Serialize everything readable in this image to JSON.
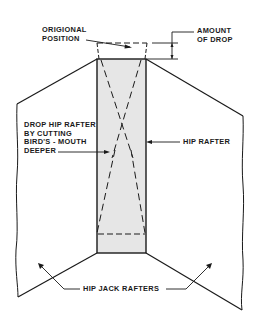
{
  "diagram": {
    "labels": {
      "original_position": [
        "ORIGIONAL",
        "POSITION"
      ],
      "amount_of_drop": [
        "AMOUNT",
        "OF DROP"
      ],
      "drop_hip_rafter": [
        "DROP HIP RAFTER",
        "BY CUTTING",
        "BIRD'S - MOUTH",
        "DEEPER"
      ],
      "hip_rafter": "HIP RAFTER",
      "hip_jack_rafters": "HIP JACK RAFTERS"
    },
    "caption_partial": "(cropped caption line at bottom edge)",
    "colors": {
      "line": "#1a1a1a",
      "rafter_fill": "#e6e6e6",
      "background": "#ffffff"
    }
  }
}
